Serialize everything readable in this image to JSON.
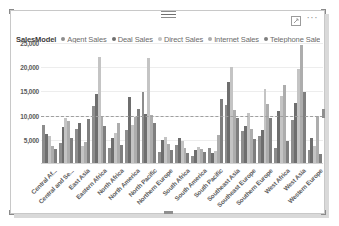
{
  "visual": {
    "header": {
      "focus_icon": "focus-mode-icon",
      "more_icon": "···"
    },
    "legend": {
      "title": "SalesModel",
      "items": [
        {
          "label": "Agent Sales",
          "color": "#8d8d8d"
        },
        {
          "label": "Deal Sales",
          "color": "#6e6e6e"
        },
        {
          "label": "Direct Sales",
          "color": "#c4c4c4"
        },
        {
          "label": "Internet Sales",
          "color": "#adadad"
        },
        {
          "label": "Telephone Sales",
          "color": "#7f7f7f"
        }
      ]
    }
  },
  "chart_data": {
    "type": "bar",
    "title": "SalesModel",
    "xlabel": "",
    "ylabel": "",
    "ylim": [
      0,
      25000
    ],
    "yticks": [
      5000,
      10000,
      15000,
      20000,
      25000
    ],
    "ytick_labels": [
      "5,000",
      "10,000",
      "15,000",
      "20,000",
      "25,000"
    ],
    "grid": true,
    "legend_position": "top",
    "reference_line": {
      "value": 10000,
      "style": "dashed",
      "color": "#9f9f9f"
    },
    "categories": [
      "Central Af...",
      "Central and Se...",
      "East Asia",
      "Eastern Africa",
      "North Africa",
      "North America",
      "North Pacific",
      "Northern Europe",
      "South Africa",
      "South America",
      "South Pacific",
      "Southeast Asia",
      "Southeast Europe",
      "Southern Europe",
      "West Africa",
      "West Asia",
      "Western Europe"
    ],
    "series": [
      {
        "name": "Agent Sales",
        "color": "#8d8d8d",
        "values": [
          7800,
          4200,
          7000,
          11800,
          3000,
          6800,
          14600,
          2200,
          3700,
          1500,
          3000,
          11900,
          6600,
          5600,
          3100,
          8900,
          2700
        ]
      },
      {
        "name": "Deal Sales",
        "color": "#6e6e6e",
        "values": [
          6000,
          7500,
          8300,
          14200,
          5200,
          13600,
          10100,
          4800,
          5100,
          2600,
          2100,
          16800,
          7600,
          6800,
          10700,
          12300,
          5200
        ]
      },
      {
        "name": "Direct Sales",
        "color": "#c4c4c4",
        "values": [
          5500,
          9200,
          3600,
          22000,
          6100,
          7800,
          21700,
          5300,
          4600,
          3300,
          2400,
          19800,
          10400,
          15300,
          13800,
          19400,
          3600
        ]
      },
      {
        "name": "Internet Sales",
        "color": "#adadad",
        "values": [
          3500,
          8600,
          4400,
          9800,
          8200,
          9600,
          10000,
          3900,
          3000,
          2900,
          5700,
          11000,
          7100,
          12200,
          16200,
          24400,
          9700
        ]
      },
      {
        "name": "Telephone Sales",
        "color": "#7f7f7f",
        "values": [
          2900,
          5200,
          9000,
          7600,
          3800,
          11200,
          8200,
          2600,
          2100,
          2300,
          13200,
          9300,
          4900,
          9400,
          4500,
          14600,
          1900
        ]
      }
    ]
  }
}
